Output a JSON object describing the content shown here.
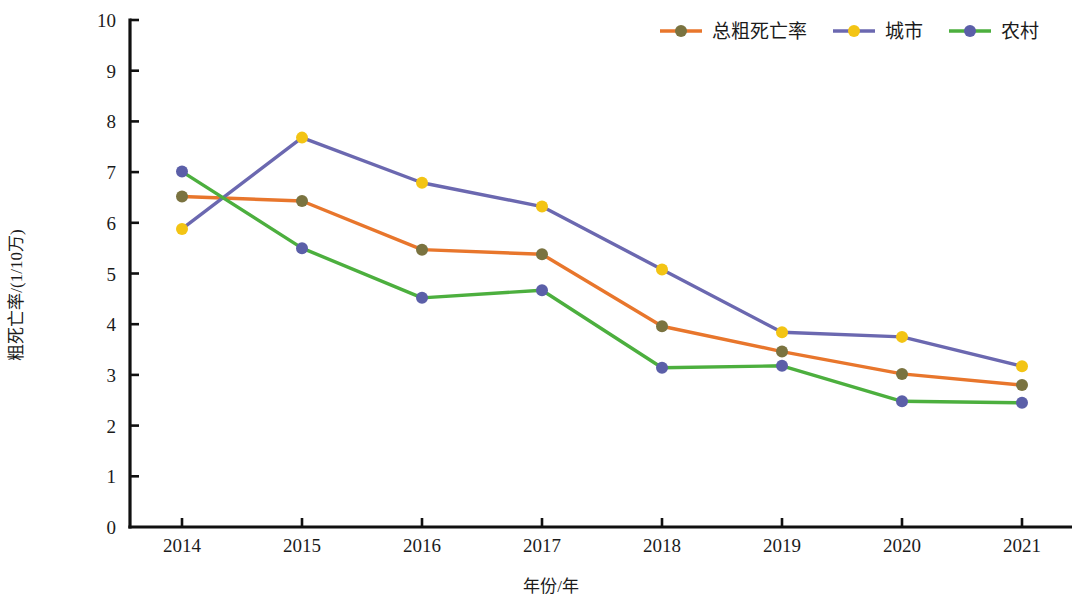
{
  "chart_data": {
    "type": "line",
    "title": "",
    "xlabel": "年份/年",
    "ylabel": "粗死亡率/(1/10万)",
    "categories": [
      "2014",
      "2015",
      "2016",
      "2017",
      "2018",
      "2019",
      "2020",
      "2021"
    ],
    "x": [
      2014,
      2015,
      2016,
      2017,
      2018,
      2019,
      2020,
      2021
    ],
    "xlim": [
      2013.6,
      2021.4
    ],
    "ylim": [
      0,
      10
    ],
    "ytick_labels": [
      "0",
      "1",
      "2",
      "3",
      "4",
      "5",
      "6",
      "7",
      "8",
      "9",
      "10"
    ],
    "ytick_values": [
      0,
      1,
      2,
      3,
      4,
      5,
      6,
      7,
      8,
      9,
      10
    ],
    "grid": false,
    "legend_position": "top-right",
    "series": [
      {
        "name": "总粗死亡率",
        "line_color": "#E8762C",
        "marker_color": "#7A7340",
        "values": [
          6.52,
          6.43,
          5.47,
          5.38,
          3.96,
          3.46,
          3.02,
          2.8
        ]
      },
      {
        "name": "城市",
        "line_color": "#6B68B0",
        "marker_color": "#F3C414",
        "values": [
          5.88,
          7.68,
          6.79,
          6.32,
          5.08,
          3.84,
          3.75,
          3.17
        ]
      },
      {
        "name": "农村",
        "line_color": "#4CAF3E",
        "marker_color": "#5B5FA8",
        "values": [
          7.01,
          5.5,
          4.52,
          4.67,
          3.14,
          3.18,
          2.48,
          2.45
        ]
      }
    ]
  },
  "axes": {
    "y_axis_title": "粗死亡率/(1/10万)",
    "x_axis_title": "年份/年"
  },
  "legend": {
    "items": [
      {
        "label": "总粗死亡率"
      },
      {
        "label": "城市"
      },
      {
        "label": "农村"
      }
    ]
  },
  "colors": {
    "axis": "#101010",
    "text": "#1b1b1b",
    "background": "#ffffff"
  }
}
